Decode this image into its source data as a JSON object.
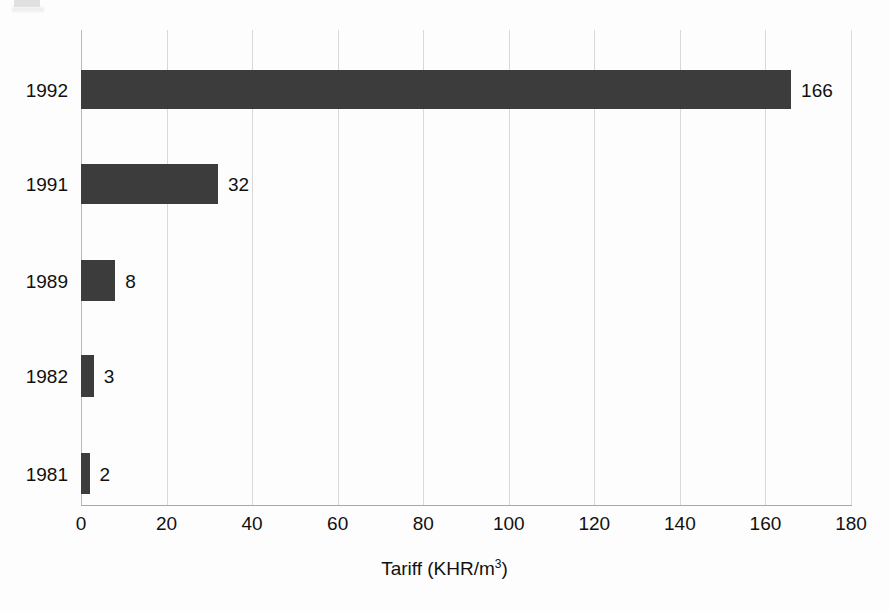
{
  "chart_data": {
    "type": "bar",
    "orientation": "horizontal",
    "title": "",
    "xlabel": "Tariff (KHR/m3)",
    "xlabel_parts": {
      "prefix": "Tariff (KHR/m",
      "superscript": "3",
      "suffix": ")"
    },
    "ylabel": "",
    "categories": [
      "1992",
      "1991",
      "1989",
      "1982",
      "1981"
    ],
    "values": [
      166,
      32,
      8,
      3,
      2
    ],
    "value_labels": [
      "166",
      "32",
      "8",
      "3",
      "2"
    ],
    "xlim": [
      0,
      180
    ],
    "xticks": [
      0,
      20,
      40,
      60,
      80,
      100,
      120,
      140,
      160,
      180
    ],
    "xtick_labels": [
      "0",
      "20",
      "40",
      "60",
      "80",
      "100",
      "120",
      "140",
      "160",
      "180"
    ],
    "grid": "vertical",
    "legend": "none",
    "bar_color": "#3c3c3c",
    "gridline_color": "#d8d8d8",
    "axis_color": "#a9a9a9",
    "background_color": "#fdfdfd",
    "text_color": "#111111"
  }
}
